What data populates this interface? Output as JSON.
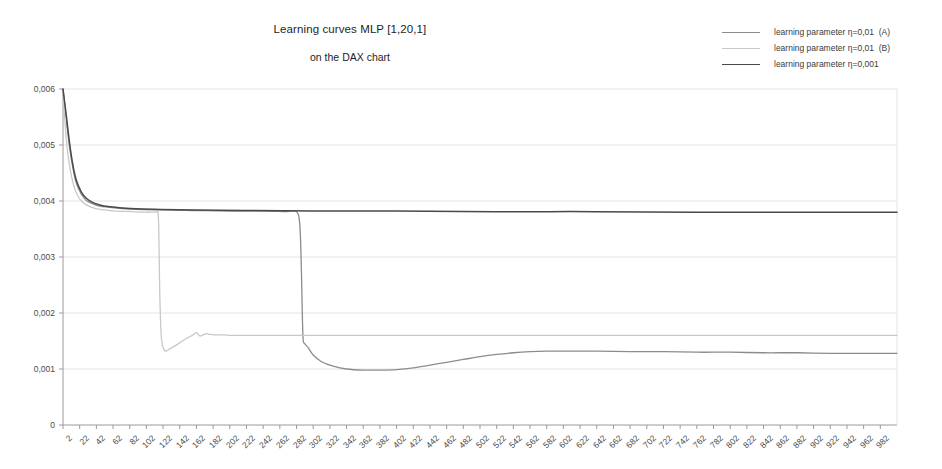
{
  "chart_data": {
    "type": "line",
    "title": "Learning curves MLP [1,20,1]",
    "subtitle": "on the DAX chart",
    "xlabel": "",
    "ylabel": "",
    "grid": true,
    "legend_position": "top-right",
    "xlim": [
      2,
      1002
    ],
    "ylim": [
      0,
      0.006
    ],
    "x_ticks": [
      2,
      22,
      42,
      62,
      82,
      102,
      122,
      142,
      162,
      182,
      202,
      222,
      242,
      262,
      282,
      302,
      322,
      342,
      362,
      382,
      402,
      422,
      442,
      462,
      482,
      502,
      522,
      542,
      562,
      582,
      602,
      622,
      642,
      662,
      682,
      702,
      722,
      742,
      762,
      782,
      802,
      822,
      842,
      862,
      882,
      902,
      922,
      942,
      962,
      982
    ],
    "y_ticks": [
      0,
      0.001,
      0.002,
      0.003,
      0.004,
      0.005,
      0.006
    ],
    "y_tick_labels": [
      "0",
      "0,001",
      "0,002",
      "0,003",
      "0,004",
      "0,005",
      "0,006"
    ],
    "decimal_separator": ",",
    "series": [
      {
        "name": "learning parameter η=0,01  (A)",
        "color": "#8c8c8c",
        "width": 1.3,
        "x": [
          2,
          6,
          10,
          14,
          18,
          24,
          30,
          38,
          46,
          56,
          70,
          90,
          120,
          160,
          200,
          240,
          270,
          282,
          286,
          288,
          289,
          290,
          292,
          296,
          302,
          312,
          326,
          342,
          362,
          382,
          402,
          422,
          442,
          462,
          482,
          502,
          522,
          542,
          562,
          582,
          602,
          642,
          682,
          722,
          762,
          802,
          842,
          882,
          922,
          962,
          1002
        ],
        "y": [
          0.006,
          0.00545,
          0.00495,
          0.00458,
          0.00432,
          0.00412,
          0.00401,
          0.00395,
          0.00391,
          0.00389,
          0.00387,
          0.00385,
          0.00384,
          0.00383,
          0.00382,
          0.00382,
          0.00381,
          0.00381,
          0.00356,
          0.00268,
          0.00195,
          0.00152,
          0.00145,
          0.00138,
          0.00125,
          0.00113,
          0.00105,
          0.001,
          0.00098,
          0.00098,
          0.00099,
          0.00102,
          0.00107,
          0.00112,
          0.00117,
          0.00122,
          0.00126,
          0.00129,
          0.00131,
          0.00132,
          0.00132,
          0.00132,
          0.00131,
          0.00131,
          0.0013,
          0.0013,
          0.00129,
          0.00129,
          0.00128,
          0.00128,
          0.00128
        ]
      },
      {
        "name": "learning parameter η=0,01  (B)",
        "color": "#c8c8c8",
        "width": 1.3,
        "x": [
          2,
          6,
          10,
          16,
          22,
          30,
          40,
          52,
          66,
          84,
          100,
          110,
          114,
          116,
          117,
          118,
          120,
          124,
          130,
          138,
          146,
          152,
          158,
          162,
          166,
          170,
          174,
          178,
          182,
          186,
          190,
          196,
          204,
          214,
          230,
          260,
          300,
          360,
          440,
          540,
          640,
          740,
          840,
          940,
          1002
        ],
        "y": [
          0.00595,
          0.0051,
          0.00462,
          0.00422,
          0.00404,
          0.00393,
          0.00387,
          0.00384,
          0.00382,
          0.00381,
          0.0038,
          0.0038,
          0.0038,
          0.0038,
          0.00336,
          0.00238,
          0.00155,
          0.00133,
          0.00136,
          0.00143,
          0.00151,
          0.00156,
          0.00161,
          0.00165,
          0.00159,
          0.00161,
          0.00163,
          0.00162,
          0.00161,
          0.00161,
          0.00161,
          0.00161,
          0.0016,
          0.0016,
          0.0016,
          0.0016,
          0.0016,
          0.0016,
          0.0016,
          0.0016,
          0.0016,
          0.0016,
          0.0016,
          0.0016,
          0.0016
        ]
      },
      {
        "name": "learning parameter η=0,001",
        "color": "#4a4a4a",
        "width": 1.5,
        "x": [
          2,
          6,
          10,
          14,
          18,
          24,
          30,
          38,
          46,
          56,
          70,
          90,
          120,
          160,
          220,
          300,
          400,
          520,
          640,
          760,
          880,
          1002
        ],
        "y": [
          0.006,
          0.00552,
          0.00502,
          0.00463,
          0.00437,
          0.00416,
          0.00405,
          0.00397,
          0.00393,
          0.0039,
          0.00388,
          0.00386,
          0.00385,
          0.00384,
          0.00383,
          0.00382,
          0.00382,
          0.00381,
          0.00381,
          0.0038,
          0.0038,
          0.0038
        ]
      }
    ]
  },
  "plot": {
    "left": 63,
    "right": 897,
    "top": 89,
    "bottom": 425,
    "grid_color": "#e3e3e3",
    "axis_color": "#9a9a9a",
    "background": "#ffffff"
  }
}
